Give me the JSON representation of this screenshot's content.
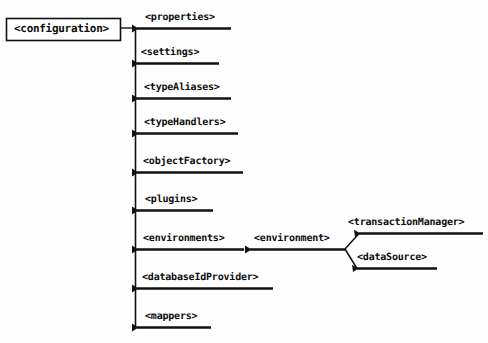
{
  "diagram": {
    "type": "element-tree",
    "background_color": "#fefefe",
    "line_color": "#111111",
    "text_color": "#0d0d0d",
    "root": {
      "label": "<configuration>",
      "boxed": true,
      "x": 6,
      "y": 18,
      "width": 114,
      "height": 22
    },
    "trunk": {
      "x": 135,
      "y_top": 28,
      "y_bottom": 327
    },
    "branches": [
      {
        "label": "<properties>",
        "y": 28,
        "line_start": 137,
        "line_end": 231,
        "text_x": 145,
        "text_y": 12
      },
      {
        "label": "<settings>",
        "y": 63,
        "line_start": 137,
        "line_end": 219,
        "text_x": 141,
        "text_y": 47
      },
      {
        "label": "<typeAliases>",
        "y": 98,
        "line_start": 137,
        "line_end": 231,
        "text_x": 144,
        "text_y": 82
      },
      {
        "label": "<typeHandlers>",
        "y": 133,
        "line_start": 137,
        "line_end": 238,
        "text_x": 144,
        "text_y": 117
      },
      {
        "label": "<objectFactory>",
        "y": 172,
        "line_start": 137,
        "line_end": 243,
        "text_x": 143,
        "text_y": 156
      },
      {
        "label": "<plugins>",
        "y": 210,
        "line_start": 137,
        "line_end": 213,
        "text_x": 145,
        "text_y": 194
      },
      {
        "label": "<environments>",
        "y": 249,
        "line_start": 137,
        "line_end": 244,
        "text_x": 143,
        "text_y": 233
      },
      {
        "label": "<databaseIdProvider>",
        "y": 288,
        "line_start": 137,
        "line_end": 273,
        "text_x": 142,
        "text_y": 272
      },
      {
        "label": "<mappers>",
        "y": 327,
        "line_start": 137,
        "line_end": 211,
        "text_x": 145,
        "text_y": 311
      }
    ],
    "environment_branch": {
      "label": "<environment>",
      "y": 249,
      "line_start": 250,
      "line_end": 345,
      "text_x": 254,
      "text_y": 233
    },
    "fork": {
      "origin_x": 345,
      "origin_y": 249,
      "children": [
        {
          "label": "<transactionManager>",
          "y": 233,
          "diagonal_from_x": 345,
          "diagonal_from_y": 249,
          "line_start": 359,
          "line_end": 483,
          "text_x": 348,
          "text_y": 217
        },
        {
          "label": "<dataSource>",
          "y": 268,
          "diagonal_from_x": 345,
          "diagonal_from_y": 249,
          "line_start": 357,
          "line_end": 437,
          "text_x": 357,
          "text_y": 252
        }
      ]
    }
  }
}
